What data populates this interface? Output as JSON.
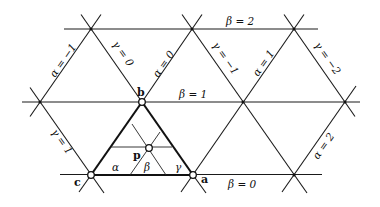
{
  "figure": {
    "colors": {
      "line": "#1a1a1a",
      "background": "#ffffff"
    }
  },
  "labels": {
    "beta": [
      {
        "id": "beta-2",
        "text": "β = 2"
      },
      {
        "id": "beta-1",
        "text": "β = 1"
      },
      {
        "id": "beta-0",
        "text": "β = 0"
      }
    ],
    "alpha": [
      {
        "id": "alpha-neg1",
        "text": "α = −1"
      },
      {
        "id": "alpha-0",
        "text": "α = 0"
      },
      {
        "id": "alpha-1",
        "text": "α = 1"
      },
      {
        "id": "alpha-2",
        "text": "α = 2"
      }
    ],
    "gamma": [
      {
        "id": "gamma-1",
        "text": "γ = 1"
      },
      {
        "id": "gamma-0",
        "text": "γ = 0"
      },
      {
        "id": "gamma-neg1",
        "text": "γ = −1"
      },
      {
        "id": "gamma-neg2",
        "text": "γ = −2"
      }
    ],
    "vertices": {
      "a": "a",
      "b": "b",
      "c": "c",
      "p": "p"
    },
    "inner": {
      "alpha": "α",
      "beta": "β",
      "gamma": "γ"
    }
  }
}
